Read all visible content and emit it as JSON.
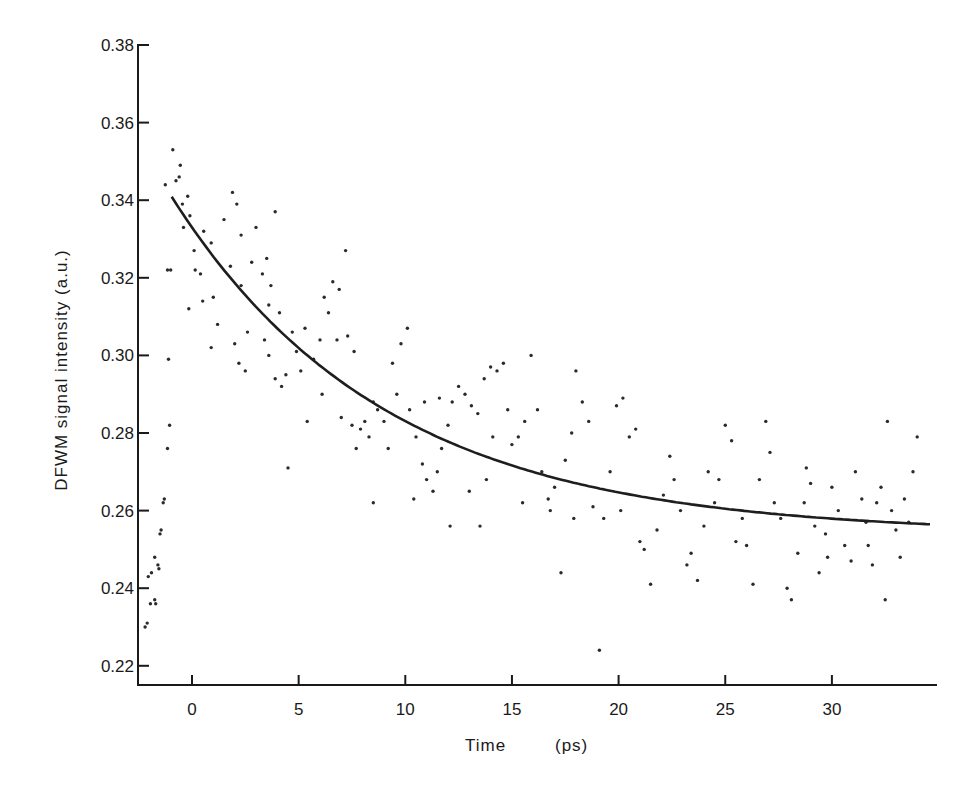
{
  "chart_data": {
    "type": "scatter",
    "title": "",
    "xlabel": "Time",
    "xlabel_unit": "(ps)",
    "ylabel": "DFWM signal intensity (a.u.)",
    "xlim": [
      -2.5,
      34.7
    ],
    "ylim": [
      0.215,
      0.38
    ],
    "xticks": [
      0,
      5,
      10,
      15,
      20,
      25,
      30
    ],
    "yticks": [
      0.22,
      0.24,
      0.26,
      0.28,
      0.3,
      0.32,
      0.34,
      0.36,
      0.38
    ],
    "ytick_labels": [
      "0.22",
      "0.24",
      "0.26",
      "0.28",
      "0.30",
      "0.32",
      "0.34",
      "0.36",
      "0.38"
    ],
    "grid": false,
    "legend": null,
    "series": [
      {
        "name": "measured data",
        "kind": "scatter",
        "points": [
          [
            -2.2,
            0.23
          ],
          [
            -2.1,
            0.231
          ],
          [
            -1.95,
            0.236
          ],
          [
            -2.05,
            0.243
          ],
          [
            -1.9,
            0.244
          ],
          [
            -1.75,
            0.237
          ],
          [
            -1.7,
            0.236
          ],
          [
            -1.6,
            0.246
          ],
          [
            -1.55,
            0.245
          ],
          [
            -1.75,
            0.248
          ],
          [
            -1.5,
            0.254
          ],
          [
            -1.45,
            0.255
          ],
          [
            -1.35,
            0.262
          ],
          [
            -1.3,
            0.263
          ],
          [
            -1.15,
            0.276
          ],
          [
            -1.05,
            0.282
          ],
          [
            -1.1,
            0.299
          ],
          [
            -1.15,
            0.322
          ],
          [
            -1.0,
            0.322
          ],
          [
            -1.25,
            0.344
          ],
          [
            -0.9,
            0.353
          ],
          [
            -0.75,
            0.345
          ],
          [
            -0.55,
            0.349
          ],
          [
            -0.6,
            0.346
          ],
          [
            -0.45,
            0.339
          ],
          [
            -0.2,
            0.341
          ],
          [
            -0.4,
            0.333
          ],
          [
            -0.1,
            0.336
          ],
          [
            0.1,
            0.327
          ],
          [
            0.15,
            0.322
          ],
          [
            0.4,
            0.321
          ],
          [
            0.55,
            0.332
          ],
          [
            0.9,
            0.329
          ],
          [
            -0.15,
            0.312
          ],
          [
            0.5,
            0.314
          ],
          [
            1.0,
            0.315
          ],
          [
            1.2,
            0.308
          ],
          [
            0.9,
            0.302
          ],
          [
            1.5,
            0.335
          ],
          [
            1.9,
            0.342
          ],
          [
            2.1,
            0.339
          ],
          [
            2.3,
            0.331
          ],
          [
            1.8,
            0.323
          ],
          [
            2.3,
            0.318
          ],
          [
            2.6,
            0.306
          ],
          [
            2.0,
            0.303
          ],
          [
            2.2,
            0.298
          ],
          [
            2.5,
            0.296
          ],
          [
            2.8,
            0.324
          ],
          [
            3.0,
            0.333
          ],
          [
            3.3,
            0.321
          ],
          [
            3.6,
            0.313
          ],
          [
            3.4,
            0.304
          ],
          [
            3.6,
            0.3
          ],
          [
            3.9,
            0.294
          ],
          [
            4.2,
            0.292
          ],
          [
            4.4,
            0.295
          ],
          [
            3.9,
            0.337
          ],
          [
            3.5,
            0.325
          ],
          [
            3.7,
            0.318
          ],
          [
            4.1,
            0.311
          ],
          [
            4.7,
            0.306
          ],
          [
            4.9,
            0.301
          ],
          [
            5.1,
            0.296
          ],
          [
            5.4,
            0.283
          ],
          [
            4.5,
            0.271
          ],
          [
            5.3,
            0.307
          ],
          [
            5.7,
            0.299
          ],
          [
            6.0,
            0.304
          ],
          [
            6.2,
            0.315
          ],
          [
            6.4,
            0.311
          ],
          [
            6.6,
            0.319
          ],
          [
            6.9,
            0.317
          ],
          [
            7.2,
            0.327
          ],
          [
            6.1,
            0.29
          ],
          [
            6.8,
            0.304
          ],
          [
            7.3,
            0.305
          ],
          [
            7.6,
            0.301
          ],
          [
            7.0,
            0.284
          ],
          [
            7.5,
            0.282
          ],
          [
            7.9,
            0.281
          ],
          [
            8.1,
            0.283
          ],
          [
            8.3,
            0.279
          ],
          [
            7.7,
            0.276
          ],
          [
            8.5,
            0.288
          ],
          [
            8.7,
            0.286
          ],
          [
            9.0,
            0.283
          ],
          [
            9.2,
            0.276
          ],
          [
            8.5,
            0.262
          ],
          [
            9.4,
            0.298
          ],
          [
            9.8,
            0.303
          ],
          [
            10.1,
            0.307
          ],
          [
            9.6,
            0.29
          ],
          [
            10.2,
            0.286
          ],
          [
            10.5,
            0.279
          ],
          [
            10.8,
            0.272
          ],
          [
            11.0,
            0.268
          ],
          [
            10.4,
            0.263
          ],
          [
            11.3,
            0.265
          ],
          [
            11.5,
            0.27
          ],
          [
            11.7,
            0.276
          ],
          [
            12.0,
            0.282
          ],
          [
            10.9,
            0.288
          ],
          [
            11.6,
            0.289
          ],
          [
            12.2,
            0.288
          ],
          [
            12.5,
            0.292
          ],
          [
            12.8,
            0.29
          ],
          [
            13.1,
            0.287
          ],
          [
            13.4,
            0.285
          ],
          [
            12.1,
            0.256
          ],
          [
            13.0,
            0.265
          ],
          [
            13.5,
            0.256
          ],
          [
            13.8,
            0.268
          ],
          [
            14.1,
            0.279
          ],
          [
            14.3,
            0.296
          ],
          [
            14.6,
            0.298
          ],
          [
            13.7,
            0.294
          ],
          [
            14.0,
            0.297
          ],
          [
            14.8,
            0.286
          ],
          [
            15.0,
            0.277
          ],
          [
            15.3,
            0.279
          ],
          [
            15.6,
            0.283
          ],
          [
            15.9,
            0.3
          ],
          [
            16.2,
            0.286
          ],
          [
            15.5,
            0.262
          ],
          [
            16.4,
            0.27
          ],
          [
            16.7,
            0.263
          ],
          [
            17.0,
            0.266
          ],
          [
            16.8,
            0.26
          ],
          [
            17.3,
            0.244
          ],
          [
            17.5,
            0.273
          ],
          [
            17.8,
            0.28
          ],
          [
            18.0,
            0.296
          ],
          [
            18.3,
            0.288
          ],
          [
            18.6,
            0.283
          ],
          [
            17.9,
            0.258
          ],
          [
            18.8,
            0.261
          ],
          [
            19.1,
            0.224
          ],
          [
            19.3,
            0.258
          ],
          [
            19.6,
            0.27
          ],
          [
            19.9,
            0.287
          ],
          [
            20.2,
            0.289
          ],
          [
            20.5,
            0.279
          ],
          [
            20.8,
            0.281
          ],
          [
            20.1,
            0.26
          ],
          [
            21.0,
            0.252
          ],
          [
            21.2,
            0.25
          ],
          [
            21.5,
            0.241
          ],
          [
            21.8,
            0.255
          ],
          [
            22.1,
            0.264
          ],
          [
            22.4,
            0.274
          ],
          [
            22.6,
            0.268
          ],
          [
            22.9,
            0.26
          ],
          [
            23.2,
            0.246
          ],
          [
            23.4,
            0.249
          ],
          [
            23.7,
            0.242
          ],
          [
            24.0,
            0.256
          ],
          [
            24.2,
            0.27
          ],
          [
            24.5,
            0.262
          ],
          [
            24.7,
            0.268
          ],
          [
            25.0,
            0.282
          ],
          [
            25.3,
            0.278
          ],
          [
            25.5,
            0.252
          ],
          [
            25.8,
            0.258
          ],
          [
            26.0,
            0.251
          ],
          [
            26.3,
            0.241
          ],
          [
            26.6,
            0.268
          ],
          [
            26.9,
            0.283
          ],
          [
            27.1,
            0.275
          ],
          [
            27.3,
            0.262
          ],
          [
            27.6,
            0.258
          ],
          [
            27.9,
            0.24
          ],
          [
            28.1,
            0.237
          ],
          [
            28.4,
            0.249
          ],
          [
            28.7,
            0.262
          ],
          [
            29.0,
            0.267
          ],
          [
            29.2,
            0.256
          ],
          [
            29.4,
            0.244
          ],
          [
            29.7,
            0.254
          ],
          [
            30.0,
            0.266
          ],
          [
            30.3,
            0.26
          ],
          [
            30.6,
            0.251
          ],
          [
            30.9,
            0.247
          ],
          [
            31.1,
            0.27
          ],
          [
            31.4,
            0.263
          ],
          [
            31.6,
            0.257
          ],
          [
            31.9,
            0.246
          ],
          [
            32.1,
            0.262
          ],
          [
            32.3,
            0.266
          ],
          [
            32.6,
            0.283
          ],
          [
            32.8,
            0.26
          ],
          [
            33.0,
            0.255
          ],
          [
            33.2,
            0.248
          ],
          [
            33.4,
            0.263
          ],
          [
            33.6,
            0.257
          ],
          [
            33.8,
            0.27
          ],
          [
            34.0,
            0.279
          ],
          [
            32.5,
            0.237
          ],
          [
            31.7,
            0.251
          ],
          [
            29.8,
            0.248
          ],
          [
            28.8,
            0.271
          ]
        ]
      },
      {
        "name": "exponential fit",
        "kind": "line",
        "model": "y = 0.254 + 0.079 * exp(-t / 10)",
        "x_range": [
          -0.95,
          34.6
        ],
        "points": [
          [
            -0.95,
            0.341
          ],
          [
            0,
            0.333
          ],
          [
            2,
            0.319
          ],
          [
            4,
            0.307
          ],
          [
            6,
            0.297
          ],
          [
            8,
            0.289
          ],
          [
            10,
            0.283
          ],
          [
            12,
            0.278
          ],
          [
            14,
            0.273
          ],
          [
            16,
            0.27
          ],
          [
            18,
            0.267
          ],
          [
            20,
            0.265
          ],
          [
            22,
            0.263
          ],
          [
            24,
            0.261
          ],
          [
            26,
            0.26
          ],
          [
            28,
            0.259
          ],
          [
            30,
            0.258
          ],
          [
            32,
            0.257
          ],
          [
            34.6,
            0.2555
          ]
        ]
      }
    ]
  },
  "layout_px": {
    "x0_px": 192,
    "px_per_x": 21.33,
    "y038_px": 45,
    "px_per_002": 77.6,
    "axis_left_px": 138,
    "axis_bottom_px": 685,
    "axis_right_px": 937
  }
}
